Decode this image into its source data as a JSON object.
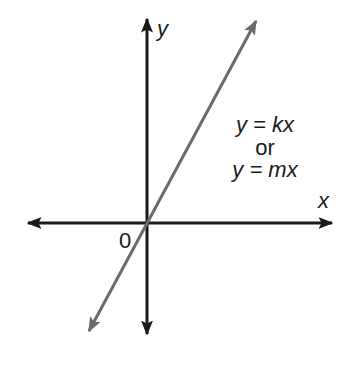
{
  "diagram": {
    "axes": {
      "x_label": "x",
      "y_label": "y",
      "origin_label": "0"
    },
    "equations": {
      "line1": "y = kx",
      "connector": "or",
      "line2": "y = mx"
    },
    "line": {
      "description": "straight line through origin with positive slope",
      "color": "#6b6b6b"
    },
    "colors": {
      "axis": "#1a1a1a",
      "line": "#6b6b6b",
      "background": "#ffffff"
    }
  }
}
